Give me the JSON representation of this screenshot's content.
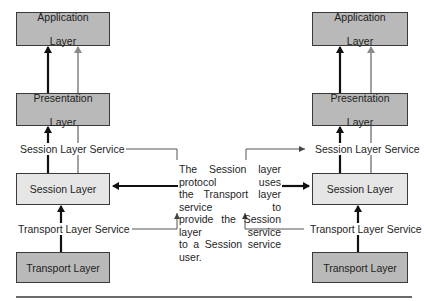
{
  "left_stack": {
    "application": {
      "line1": "Application",
      "line2": "Layer"
    },
    "presentation": {
      "line1": "Presentation",
      "line2": "Layer"
    },
    "session_service_label": "Session Layer Service",
    "session": "Session Layer",
    "transport_service_label": "Transport Layer Service",
    "transport": "Transport Layer"
  },
  "right_stack": {
    "application": {
      "line1": "Application",
      "line2": "Layer"
    },
    "presentation": {
      "line1": "Presentation",
      "line2": "Layer"
    },
    "session_service_label": "Session Layer Service",
    "session": "Session Layer",
    "transport_service_label": "Transport Layer Service",
    "transport": "Transport Layer"
  },
  "description": {
    "lines": [
      "The Session layer protocol uses",
      "the Transport layer service to",
      "provide the Session layer service",
      "to a Session service user."
    ]
  },
  "colors": {
    "dark_box": "#b9b9b9",
    "light_box": "#e6e6e6",
    "black_arrow": "#111111",
    "grey_arrow": "#8a8a8a",
    "connector": "#555555"
  }
}
